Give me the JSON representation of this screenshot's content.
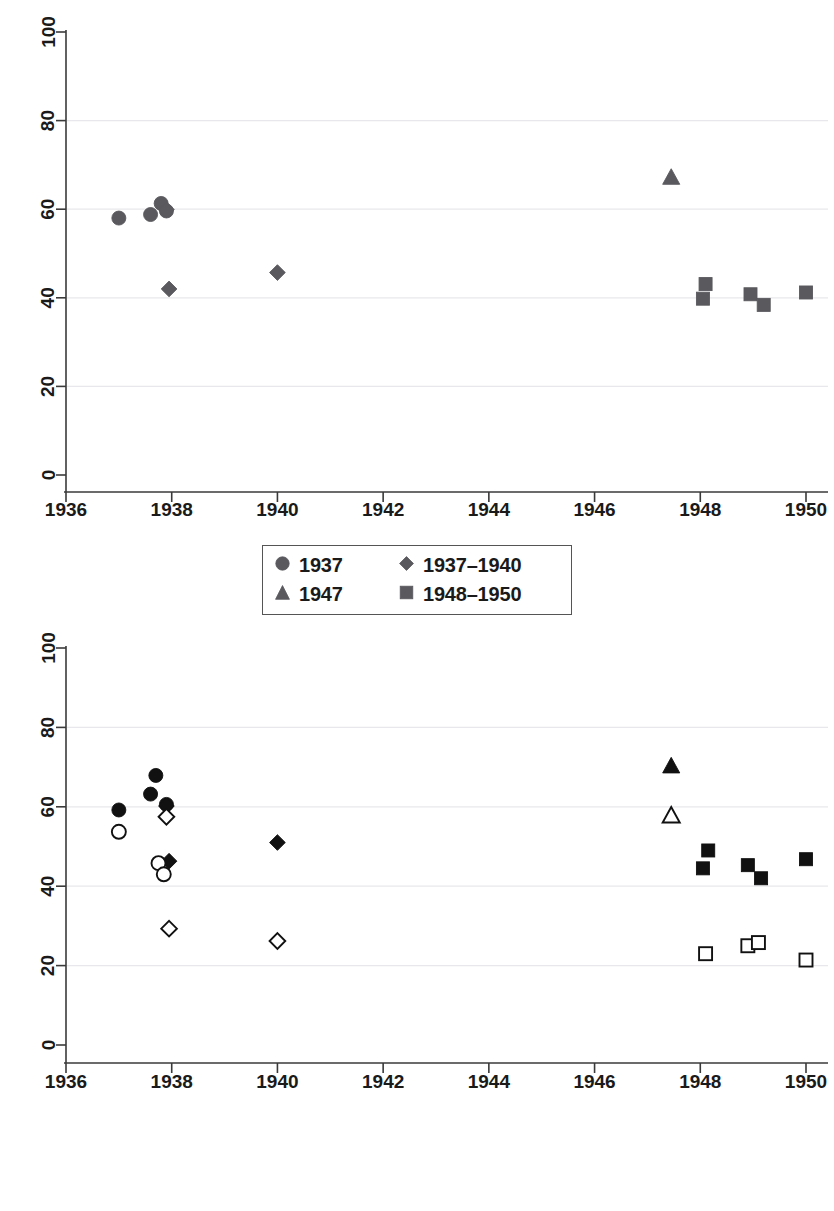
{
  "figure": {
    "background": "#ffffff",
    "marker_gray": "#59595e",
    "marker_black": "#111111"
  },
  "panels": [
    {
      "id": "top",
      "axes": {
        "xlabel": "",
        "ylabel": "",
        "xticks": [
          "1936",
          "1938",
          "1940",
          "1942",
          "1944",
          "1946",
          "1948",
          "1950"
        ],
        "yticks": [
          "0",
          "20",
          "40",
          "60",
          "80",
          "100"
        ],
        "xlim": [
          1936,
          1950
        ],
        "ylim": [
          0,
          100
        ],
        "grid": "horizontal"
      },
      "legend": {
        "position": "below-axis",
        "entries": [
          {
            "label": "1937",
            "marker": "circle",
            "fill": "solid",
            "color": "#59595e"
          },
          {
            "label": "1937–1940",
            "marker": "diamond",
            "fill": "solid",
            "color": "#59595e"
          },
          {
            "label": "1947",
            "marker": "triangle",
            "fill": "solid",
            "color": "#59595e"
          },
          {
            "label": "1948–1950",
            "marker": "square",
            "fill": "solid",
            "color": "#59595e"
          }
        ]
      }
    },
    {
      "id": "bottom",
      "axes": {
        "xlabel": "",
        "ylabel": "",
        "xticks": [
          "1936",
          "1938",
          "1940",
          "1942",
          "1944",
          "1946",
          "1948",
          "1950"
        ],
        "yticks": [
          "0",
          "20",
          "40",
          "60",
          "80",
          "100"
        ],
        "xlim": [
          1936,
          1950
        ],
        "ylim": [
          0,
          100
        ],
        "grid": "horizontal"
      },
      "legend": {
        "position": "below-axis",
        "clipped_at_image_bottom": true,
        "entries": [
          {
            "label": "Non-South (1937)",
            "marker": "circle",
            "fill": "solid",
            "color": "#111111"
          },
          {
            "label": "Non-South (1937–1940)",
            "marker": "diamond",
            "fill": "solid",
            "color": "#111111"
          },
          {
            "label": "Non-South (1947)",
            "marker": "triangle",
            "fill": "solid",
            "color": "#111111"
          },
          {
            "label": "Non-South (1948–1950)",
            "marker": "square",
            "fill": "solid",
            "color": "#111111"
          },
          {
            "label": "South (1937)",
            "marker": "circle",
            "fill": "hollow",
            "color": "#111111"
          },
          {
            "label": "South (1937–1940)",
            "marker": "diamond",
            "fill": "hollow",
            "color": "#111111"
          }
        ]
      }
    }
  ],
  "chart_data": [
    {
      "type": "scatter",
      "panel": "top",
      "title": "",
      "xlabel": "",
      "ylabel": "",
      "xlim": [
        1936,
        1950
      ],
      "ylim": [
        0,
        100
      ],
      "grid": "horizontal gridlines at 20, 40, 60, 80",
      "legend_position": "below plot, centered",
      "series": [
        {
          "name": "1937",
          "marker": "circle",
          "fill": "solid",
          "color": "#59595e",
          "points": [
            {
              "x": 1937.0,
              "y": 58.0
            },
            {
              "x": 1937.6,
              "y": 58.8
            },
            {
              "x": 1937.8,
              "y": 61.3
            },
            {
              "x": 1937.9,
              "y": 59.6
            }
          ]
        },
        {
          "name": "1937–1940",
          "marker": "diamond",
          "fill": "solid",
          "color": "#59595e",
          "points": [
            {
              "x": 1937.9,
              "y": 59.9
            },
            {
              "x": 1937.95,
              "y": 42.0
            },
            {
              "x": 1940.0,
              "y": 45.7
            }
          ]
        },
        {
          "name": "1947",
          "marker": "triangle",
          "fill": "solid",
          "color": "#59595e",
          "points": [
            {
              "x": 1947.45,
              "y": 67.2
            }
          ]
        },
        {
          "name": "1948–1950",
          "marker": "square",
          "fill": "solid",
          "color": "#59595e",
          "points": [
            {
              "x": 1948.1,
              "y": 43.1
            },
            {
              "x": 1948.05,
              "y": 39.8
            },
            {
              "x": 1948.95,
              "y": 40.8
            },
            {
              "x": 1949.2,
              "y": 38.4
            },
            {
              "x": 1950.0,
              "y": 41.2
            }
          ]
        }
      ]
    },
    {
      "type": "scatter",
      "panel": "bottom",
      "title": "",
      "xlabel": "",
      "ylabel": "",
      "xlim": [
        1936,
        1950
      ],
      "ylim": [
        0,
        100
      ],
      "grid": "horizontal gridlines at 20, 40, 60, 80",
      "legend_position": "below plot, centered",
      "series": [
        {
          "name": "Non-South (1937)",
          "marker": "circle",
          "fill": "solid",
          "color": "#111111",
          "points": [
            {
              "x": 1937.0,
              "y": 59.2
            },
            {
              "x": 1937.6,
              "y": 63.2
            },
            {
              "x": 1937.7,
              "y": 67.9
            },
            {
              "x": 1937.9,
              "y": 60.6
            }
          ]
        },
        {
          "name": "Non-South (1937–1940)",
          "marker": "diamond",
          "fill": "solid",
          "color": "#111111",
          "points": [
            {
              "x": 1937.9,
              "y": 60.2
            },
            {
              "x": 1937.95,
              "y": 46.3
            },
            {
              "x": 1940.0,
              "y": 51.0
            }
          ]
        },
        {
          "name": "Non-South (1947)",
          "marker": "triangle",
          "fill": "solid",
          "color": "#111111",
          "points": [
            {
              "x": 1947.45,
              "y": 70.3
            }
          ]
        },
        {
          "name": "Non-South (1948–1950)",
          "marker": "square",
          "fill": "solid",
          "color": "#111111",
          "points": [
            {
              "x": 1948.15,
              "y": 49.0
            },
            {
              "x": 1948.05,
              "y": 44.5
            },
            {
              "x": 1948.9,
              "y": 45.3
            },
            {
              "x": 1949.15,
              "y": 42.0
            },
            {
              "x": 1950.0,
              "y": 46.8
            }
          ]
        },
        {
          "name": "South (1937)",
          "marker": "circle",
          "fill": "hollow",
          "color": "#111111",
          "points": [
            {
              "x": 1937.0,
              "y": 53.7
            },
            {
              "x": 1937.75,
              "y": 45.8
            },
            {
              "x": 1937.85,
              "y": 43.0
            }
          ]
        },
        {
          "name": "South (1937–1940)",
          "marker": "diamond",
          "fill": "hollow",
          "color": "#111111",
          "points": [
            {
              "x": 1937.9,
              "y": 57.5
            },
            {
              "x": 1937.95,
              "y": 29.3
            },
            {
              "x": 1940.0,
              "y": 26.2
            }
          ]
        },
        {
          "name": "South (1947)",
          "marker": "triangle",
          "fill": "hollow",
          "color": "#111111",
          "points": [
            {
              "x": 1947.45,
              "y": 57.8
            }
          ]
        },
        {
          "name": "South (1948–1950)",
          "marker": "square",
          "fill": "hollow",
          "color": "#111111",
          "points": [
            {
              "x": 1948.1,
              "y": 23.0
            },
            {
              "x": 1948.9,
              "y": 25.0
            },
            {
              "x": 1949.1,
              "y": 25.8
            },
            {
              "x": 1950.0,
              "y": 21.4
            }
          ]
        }
      ]
    }
  ]
}
